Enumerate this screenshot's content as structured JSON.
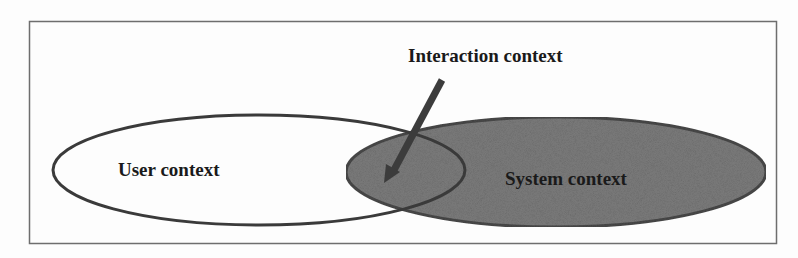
{
  "diagram": {
    "type": "venn",
    "frame": {
      "x": 29,
      "y": 21,
      "width": 747,
      "height": 222,
      "stroke": "#6e6e6e"
    },
    "sets": [
      {
        "id": "user",
        "label": "User context",
        "shape": "ellipse",
        "cx": 259,
        "cy": 170,
        "rx": 206,
        "ry": 55,
        "fill": "#ffffff",
        "stroke": "#3a3a3a"
      },
      {
        "id": "system",
        "label": "System context",
        "shape": "ellipse",
        "cx": 556,
        "cy": 172,
        "rx": 210,
        "ry": 55,
        "fill": "#7a7a7a",
        "stroke": "#454545"
      }
    ],
    "intersection": {
      "label": "Interaction context",
      "arrow": {
        "from": [
          442,
          80
        ],
        "to": [
          390,
          178
        ],
        "color": "#3c3c3c"
      }
    }
  }
}
